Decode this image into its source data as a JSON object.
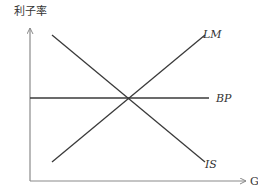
{
  "diagram": {
    "type": "IS-LM-BP model",
    "y_axis_label": "利子率",
    "x_axis_label": "GDP",
    "curves": [
      {
        "name": "IS",
        "label": "IS",
        "slope": "downward"
      },
      {
        "name": "LM",
        "label": "LM",
        "slope": "upward"
      },
      {
        "name": "BP",
        "label": "BP",
        "slope": "horizontal"
      }
    ],
    "intersection": "all three curves intersect at a single point",
    "colors": {
      "line": "#3a3a3a",
      "axis": "#8a8a8a",
      "text": "#333333"
    }
  }
}
